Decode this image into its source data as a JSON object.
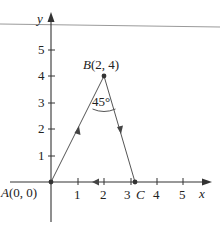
{
  "diagram": {
    "type": "coordinate-triangle-path",
    "axes": {
      "x_label": "x",
      "y_label": "y",
      "x_ticks": [
        "1",
        "2",
        "3",
        "4",
        "5"
      ],
      "y_ticks": [
        "1",
        "2",
        "3",
        "4",
        "5"
      ]
    },
    "points": {
      "A": {
        "label": "A(0, 0)",
        "x": 0,
        "y": 0
      },
      "B": {
        "label": "B(2, 4)",
        "x": 2,
        "y": 4
      },
      "C": {
        "label": "C",
        "x": 3.2,
        "y": 0
      }
    },
    "angle_label": "45°",
    "path": [
      {
        "from": "A",
        "to": "B",
        "direction": "A→B"
      },
      {
        "from": "B",
        "to": "C",
        "direction": "B→C"
      },
      {
        "from": "C",
        "to": "A",
        "direction": "C→A"
      }
    ],
    "colors": {
      "axis": "#333333",
      "segment": "#555555",
      "top_rule": "#999999"
    }
  }
}
